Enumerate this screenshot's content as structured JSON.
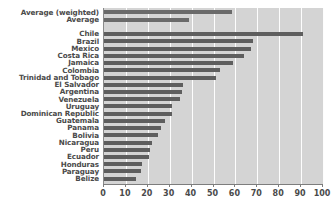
{
  "chart_data": {
    "type": "bar",
    "orientation": "horizontal",
    "title": "",
    "subtitle": "",
    "xlabel": "",
    "ylabel": "",
    "xlim": [
      0,
      100
    ],
    "ylim": null,
    "grid": true,
    "legend": null,
    "legend_position": "none",
    "xticks": [
      0,
      10,
      20,
      30,
      40,
      50,
      60,
      70,
      80,
      90,
      100
    ],
    "xtick_labels": [
      "0",
      "10",
      "20",
      "30",
      "40",
      "50",
      "60",
      "70",
      "80",
      "90",
      "100"
    ],
    "categories": [
      "Average (weighted)",
      "Average",
      "Chile",
      "Brazil",
      "Mexico",
      "Costa Rica",
      "Jamaica",
      "Colombia",
      "Trinidad and Tobago",
      "El Salvador",
      "Argentina",
      "Venezuela",
      "Uruguay",
      "Dominican Republic",
      "Guatemala",
      "Panama",
      "Bolivia",
      "Nicaragua",
      "Peru",
      "Ecuador",
      "Honduras",
      "Paraguay",
      "Belize"
    ],
    "values": [
      58.5,
      39.0,
      91.0,
      68.0,
      67.0,
      64.0,
      59.0,
      53.0,
      51.0,
      36.0,
      35.5,
      34.5,
      31.0,
      31.0,
      28.0,
      26.0,
      24.5,
      22.0,
      21.0,
      20.5,
      17.5,
      17.0,
      14.5
    ],
    "group_breaks": [
      2
    ],
    "colors": {
      "bar": "#5e5e5e",
      "average_bar": "#6a6a6a",
      "plot_background": "#d4d4d4",
      "gridline": "#fdfdfd",
      "axis": "#7d7d7d",
      "text": "#4a4a4a",
      "page_background": "#ffffff"
    }
  }
}
